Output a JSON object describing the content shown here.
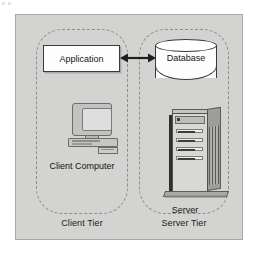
{
  "figure": {
    "type": "two-tier client/server architecture diagram",
    "background_color": "#d3d3d1",
    "frame_border_color": "#a8a8a6"
  },
  "tiers": [
    {
      "id": "client",
      "label": "Client Tier"
    },
    {
      "id": "server",
      "label": "Server Tier"
    }
  ],
  "nodes": {
    "application": {
      "label": "Application",
      "shape": "rectangle",
      "fill": "#fdfdfd",
      "stroke": "#3a3a3a"
    },
    "database": {
      "label": "Database",
      "shape": "cylinder",
      "fill": "#fdfdfd",
      "stroke": "#3a3a3a"
    },
    "client_computer": {
      "label": "Client Computer",
      "icon": "desktop-computer-icon"
    },
    "server": {
      "label": "Server",
      "icon": "server-tower-icon"
    }
  },
  "connector": {
    "id": "application-database-link",
    "style": "double-headed-arrow",
    "from": "Application",
    "to": "Database",
    "color": "#1f1f1f"
  }
}
